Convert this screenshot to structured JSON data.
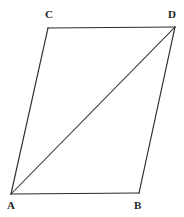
{
  "figure": {
    "kind": "geometry-diagram",
    "background_color": "#ffffff",
    "line_color": "#2b2b2b",
    "diagonal_color": "#3a3a3a",
    "label_color": "#1f1f1f",
    "canvas": {
      "width": 184,
      "height": 217
    },
    "vertices": [
      {
        "id": "A",
        "label": "A",
        "x": 11,
        "y": 194,
        "label_x": 7,
        "label_y": 200
      },
      {
        "id": "B",
        "label": "B",
        "x": 139,
        "y": 193,
        "label_x": 134,
        "label_y": 200
      },
      {
        "id": "C",
        "label": "C",
        "x": 48,
        "y": 28,
        "label_x": 45,
        "label_y": 9
      },
      {
        "id": "D",
        "label": "D",
        "x": 175,
        "y": 27,
        "label_x": 168,
        "label_y": 9
      }
    ],
    "edges": [
      {
        "id": "AB",
        "name": "bottom-edge",
        "from": "A",
        "to": "B",
        "x1": 11,
        "y1": 194,
        "x2": 139,
        "y2": 193
      },
      {
        "id": "CD",
        "name": "top-edge",
        "from": "C",
        "to": "D",
        "x1": 48,
        "y1": 28,
        "x2": 175,
        "y2": 27
      },
      {
        "id": "AC",
        "name": "left-edge",
        "from": "A",
        "to": "C",
        "x1": 11,
        "y1": 194,
        "x2": 48,
        "y2": 28
      },
      {
        "id": "BD",
        "name": "right-edge",
        "from": "B",
        "to": "D",
        "x1": 139,
        "y1": 193,
        "x2": 175,
        "y2": 27
      }
    ],
    "diagonals": [
      {
        "id": "AD",
        "name": "diagonal",
        "from": "A",
        "to": "D",
        "x1": 11,
        "y1": 194,
        "x2": 175,
        "y2": 27
      }
    ]
  }
}
